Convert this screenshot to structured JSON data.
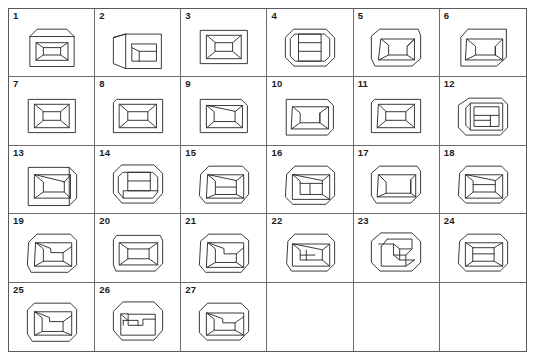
{
  "plate": {
    "title": "Line drawings of box-like objects",
    "description": "A bordered plate arranged as a 6-column by 5-row table containing 27 numbered monochrome line drawings of rectangular box / frame shapes drawn in perspective.",
    "columns": 6,
    "rows": 5,
    "total_figures": 27,
    "colors": {
      "background": "#ffffff",
      "border": "#5a5a5a",
      "grid_line": "#6b6b6b",
      "ink": "#2a2a2a",
      "label": "#1b1b1b"
    }
  },
  "figures": [
    {
      "number": "1",
      "shape": "box-front-chamfered-top-inner-rect",
      "kind": "drawing"
    },
    {
      "number": "2",
      "shape": "box-oblique-left-inner-rect",
      "kind": "drawing"
    },
    {
      "number": "3",
      "shape": "frame-recessed-pyramid-inner-rect",
      "kind": "drawing"
    },
    {
      "number": "4",
      "shape": "octagon-frame-three-horizontal-bands",
      "kind": "drawing"
    },
    {
      "number": "5",
      "shape": "box-chamfered-inner-l-notch",
      "kind": "drawing"
    },
    {
      "number": "6",
      "shape": "box-chamfered-inner-rect-right-panel",
      "kind": "drawing"
    },
    {
      "number": "7",
      "shape": "frame-recessed-pyramid-inner-rect",
      "kind": "drawing"
    },
    {
      "number": "8",
      "shape": "frame-recessed-pyramid-inner-rect-wide",
      "kind": "drawing"
    },
    {
      "number": "9",
      "shape": "box-rounded-corner-inner-rect",
      "kind": "drawing"
    },
    {
      "number": "10",
      "shape": "box-chamfered-inner-l-notch",
      "kind": "drawing"
    },
    {
      "number": "11",
      "shape": "frame-recessed-pyramid-inner-rect",
      "kind": "drawing"
    },
    {
      "number": "12",
      "shape": "box-oblique-left-three-bands",
      "kind": "drawing"
    },
    {
      "number": "13",
      "shape": "box-oblique-right-inner-rect",
      "kind": "drawing"
    },
    {
      "number": "14",
      "shape": "octagon-frame-inner-rect-split",
      "kind": "drawing"
    },
    {
      "number": "15",
      "shape": "octagon-box-inner-rect-split",
      "kind": "drawing"
    },
    {
      "number": "16",
      "shape": "octagon-box-inner-square-divider",
      "kind": "drawing"
    },
    {
      "number": "17",
      "shape": "box-chamfered-inner-trapezoid",
      "kind": "drawing"
    },
    {
      "number": "18",
      "shape": "octagon-box-inner-rect-bar",
      "kind": "drawing"
    },
    {
      "number": "19",
      "shape": "box-chamfered-spiral-l-shape",
      "kind": "drawing"
    },
    {
      "number": "20",
      "shape": "box-chamfered-nested-rect",
      "kind": "drawing"
    },
    {
      "number": "21",
      "shape": "octagon-box-spiral-l-shape",
      "kind": "drawing"
    },
    {
      "number": "22",
      "shape": "box-chamfered-inner-narrow-bar",
      "kind": "drawing"
    },
    {
      "number": "23",
      "shape": "octagon-interlocked-spiral",
      "kind": "drawing"
    },
    {
      "number": "24",
      "shape": "octagon-box-inner-rect-bands",
      "kind": "drawing"
    },
    {
      "number": "25",
      "shape": "box-chamfered-spiral-l-shape",
      "kind": "drawing"
    },
    {
      "number": "26",
      "shape": "octagon-box-inner-bar-spiral",
      "kind": "drawing"
    },
    {
      "number": "27",
      "shape": "octagon-box-spiral-l-shape",
      "kind": "drawing"
    },
    {
      "number": "",
      "shape": "",
      "kind": "empty"
    },
    {
      "number": "",
      "shape": "",
      "kind": "empty"
    },
    {
      "number": "",
      "shape": "",
      "kind": "empty"
    }
  ]
}
